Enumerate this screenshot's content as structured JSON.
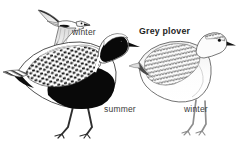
{
  "plate": {
    "title": "Grey plover",
    "background_color": "#ffffff",
    "width": 237,
    "height": 144,
    "subject": "Grey plover",
    "figure_count": 3
  },
  "labels": [
    {
      "id": "winter-flight",
      "text": "winter",
      "bold": false
    },
    {
      "id": "title",
      "text": "Grey plover",
      "bold": true
    },
    {
      "id": "summer",
      "text": "summer",
      "bold": false
    },
    {
      "id": "winter-stand",
      "text": "winter",
      "bold": false
    }
  ],
  "figures": [
    {
      "id": "flying-bird",
      "pose": "in flight",
      "plumage": "winter",
      "label": "winter",
      "description": "Pale grey and white plover in flight with outstretched pointed wings, dark wing tips and a black axillary patch under the wing"
    },
    {
      "id": "summer-bird",
      "pose": "standing",
      "plumage": "summer",
      "label": "summer",
      "description": "Standing plover with jet black face, throat, breast and belly, broad white crown and neck border, and a heavily mottled black and white speckled back"
    },
    {
      "id": "winter-bird",
      "pose": "standing",
      "plumage": "winter",
      "label": "winter",
      "description": "Standing plover in pale grey and white plumage with finely scalloped grey back feathers, white underparts, dark eye and short black bill"
    }
  ],
  "palette": {
    "ink": "#000000",
    "dark_grey": "#3a3a3a",
    "mid_grey": "#8c8c8c",
    "light_grey": "#c9c9c9",
    "pale_grey": "#e4e4e4",
    "paper": "#ffffff"
  }
}
